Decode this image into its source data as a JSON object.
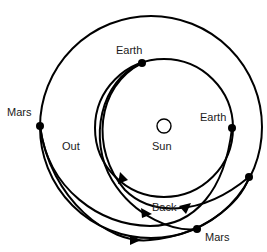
{
  "bodies": {
    "sun": {
      "label": "Sun"
    },
    "earth_orbit": {
      "label": "Earth orbit"
    },
    "mars_orbit": {
      "label": "Mars orbit"
    }
  },
  "labels": {
    "earth_depart": "Earth",
    "earth_arrive": "Earth",
    "mars_depart": "Mars",
    "mars_arrive": "Mars",
    "sun": "Sun",
    "out": "Out",
    "back": "Back"
  },
  "colors": {
    "line": "#000000",
    "background": "#ffffff",
    "text": "#1a1a1a"
  }
}
